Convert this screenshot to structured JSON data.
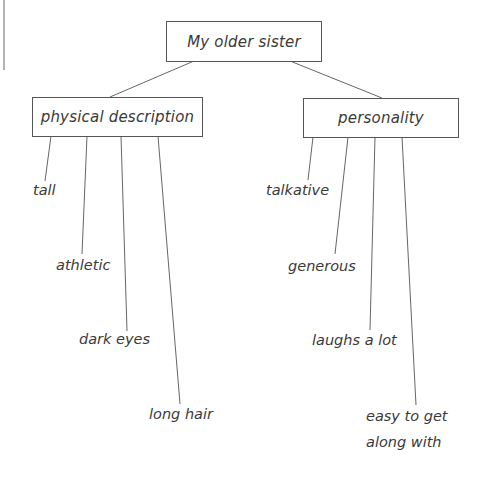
{
  "diagram": {
    "type": "tree",
    "root": {
      "label": "My older sister"
    },
    "branches": [
      {
        "label": "physical description",
        "leaves": [
          "tall",
          "athletic",
          "dark eyes",
          "long hair"
        ]
      },
      {
        "label": "personality",
        "leaves": [
          "talkative",
          "generous",
          "laughs a lot",
          "easy to get along with"
        ]
      }
    ],
    "easy_line1": "easy to get",
    "easy_line2": "along with"
  },
  "colors": {
    "line": "#555555",
    "text": "#3a3a3a",
    "background": "#ffffff"
  }
}
